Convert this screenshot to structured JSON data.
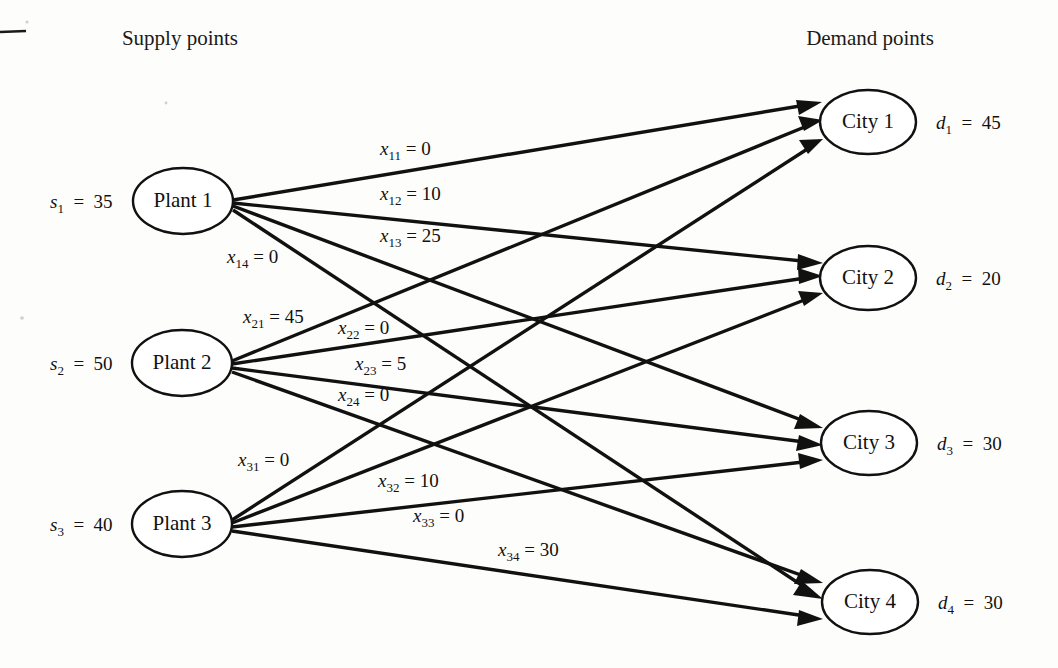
{
  "figure": {
    "type": "network-diagram",
    "headers": {
      "left": "Supply points",
      "right": "Demand points"
    }
  },
  "supply_nodes": [
    {
      "id": "plant1",
      "label": "Plant 1",
      "supply_var": "s",
      "supply_sub": "1",
      "supply_eq": "=",
      "supply_value": "35",
      "cx": 183,
      "cy": 201,
      "rx": 50,
      "ry": 33
    },
    {
      "id": "plant2",
      "label": "Plant 2",
      "supply_var": "s",
      "supply_sub": "2",
      "supply_eq": "=",
      "supply_value": "50",
      "cx": 182,
      "cy": 363,
      "rx": 50,
      "ry": 33
    },
    {
      "id": "plant3",
      "label": "Plant 3",
      "supply_var": "s",
      "supply_sub": "3",
      "supply_eq": "=",
      "supply_value": "40",
      "cx": 182,
      "cy": 524,
      "rx": 50,
      "ry": 33
    }
  ],
  "demand_nodes": [
    {
      "id": "city1",
      "label": "City 1",
      "demand_var": "d",
      "demand_sub": "1",
      "demand_eq": "=",
      "demand_value": "45",
      "cx": 868,
      "cy": 122,
      "rx": 48,
      "ry": 32
    },
    {
      "id": "city2",
      "label": "City 2",
      "demand_var": "d",
      "demand_sub": "2",
      "demand_eq": "=",
      "demand_value": "20",
      "cx": 868,
      "cy": 278,
      "rx": 48,
      "ry": 32
    },
    {
      "id": "city3",
      "label": "City 3",
      "demand_var": "d",
      "demand_sub": "3",
      "demand_eq": "=",
      "demand_value": "30",
      "cx": 869,
      "cy": 443,
      "rx": 48,
      "ry": 32
    },
    {
      "id": "city4",
      "label": "City 4",
      "demand_var": "d",
      "demand_sub": "4",
      "demand_eq": "=",
      "demand_value": "30",
      "cx": 870,
      "cy": 602,
      "rx": 48,
      "ry": 32
    }
  ],
  "edges": [
    {
      "id": "x11",
      "from": "plant1",
      "to": "city1",
      "var": "x",
      "sub": "11",
      "eq": "=",
      "value": "0",
      "label_x": 380,
      "label_y": 155
    },
    {
      "id": "x12",
      "from": "plant1",
      "to": "city2",
      "var": "x",
      "sub": "12",
      "eq": "=",
      "value": "10",
      "label_x": 380,
      "label_y": 200
    },
    {
      "id": "x13",
      "from": "plant1",
      "to": "city3",
      "var": "x",
      "sub": "13",
      "eq": "=",
      "value": "25",
      "label_x": 380,
      "label_y": 242
    },
    {
      "id": "x14",
      "from": "plant1",
      "to": "city4",
      "var": "x",
      "sub": "14",
      "eq": "=",
      "value": "0",
      "label_x": 227,
      "label_y": 263
    },
    {
      "id": "x21",
      "from": "plant2",
      "to": "city1",
      "var": "x",
      "sub": "21",
      "eq": "=",
      "value": "45",
      "label_x": 243,
      "label_y": 323
    },
    {
      "id": "x22",
      "from": "plant2",
      "to": "city2",
      "var": "x",
      "sub": "22",
      "eq": "=",
      "value": "0",
      "label_x": 338,
      "label_y": 334
    },
    {
      "id": "x23",
      "from": "plant2",
      "to": "city3",
      "var": "x",
      "sub": "23",
      "eq": "=",
      "value": "5",
      "label_x": 355,
      "label_y": 370
    },
    {
      "id": "x24",
      "from": "plant2",
      "to": "city4",
      "var": "x",
      "sub": "24",
      "eq": "=",
      "value": "0",
      "label_x": 338,
      "label_y": 401
    },
    {
      "id": "x31",
      "from": "plant3",
      "to": "city1",
      "var": "x",
      "sub": "31",
      "eq": "=",
      "value": "0",
      "label_x": 238,
      "label_y": 466
    },
    {
      "id": "x32",
      "from": "plant3",
      "to": "city2",
      "var": "x",
      "sub": "32",
      "eq": "=",
      "value": "10",
      "label_x": 378,
      "label_y": 487
    },
    {
      "id": "x33",
      "from": "plant3",
      "to": "city3",
      "var": "x",
      "sub": "33",
      "eq": "=",
      "value": "0",
      "label_x": 413,
      "label_y": 522
    },
    {
      "id": "x34",
      "from": "plant3",
      "to": "city4",
      "var": "x",
      "sub": "34",
      "eq": "=",
      "value": "30",
      "label_x": 498,
      "label_y": 556
    }
  ],
  "chart_data": {
    "type": "diagram",
    "supply": {
      "s1": 35,
      "s2": 50,
      "s3": 40
    },
    "demand": {
      "d1": 45,
      "d2": 20,
      "d3": 30,
      "d4": 30
    },
    "shipments": {
      "x11": 0,
      "x12": 10,
      "x13": 25,
      "x14": 0,
      "x21": 45,
      "x22": 0,
      "x23": 5,
      "x24": 0,
      "x31": 0,
      "x32": 10,
      "x33": 0,
      "x34": 30
    }
  },
  "colors": {
    "ink": "#111111",
    "paper": "#fdfdfc"
  }
}
